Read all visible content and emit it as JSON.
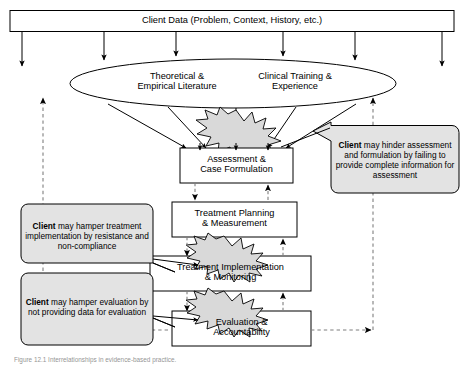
{
  "figure": {
    "type": "flow-diagram",
    "title_box": {
      "label": "Client Data (Problem, Context, History, etc.)"
    },
    "ellipse": {
      "name": "knowledge-base-ellipse",
      "labels": [
        "Theoretical &\nEmpirical Literature",
        "Clinical Training &\nExperience"
      ]
    },
    "process_boxes": [
      {
        "id": "assessment",
        "label": "Assessment &\nCase Formulation"
      },
      {
        "id": "planning",
        "label": "Treatment Planning\n& Measurement"
      },
      {
        "id": "implementation",
        "label": "Treatment Implementation\n& Monitoring"
      },
      {
        "id": "evaluation",
        "label": "Evaluation &\nAccountability"
      }
    ],
    "callouts": [
      {
        "id": "callout-assessment",
        "side": "right",
        "bold_lead": "Client",
        "rest": " may hinder assessment and formulation by failing to provide complete information for assessment",
        "full": "Client may hinder assessment and formulation by failing to provide complete information for assessment"
      },
      {
        "id": "callout-implementation",
        "side": "left",
        "bold_lead": "Client",
        "rest": " may hamper treatment implementation by resistance and non-compliance",
        "full": "Client may hamper treatment implementation by resistance and non-compliance"
      },
      {
        "id": "callout-evaluation",
        "side": "left",
        "bold_lead": "Client",
        "rest": " may hamper evaluation by not providing data for evaluation",
        "full": "Client may hamper evaluation by not providing data for evaluation"
      }
    ],
    "bursts": [
      {
        "id": "burst-assessment"
      },
      {
        "id": "burst-implementation"
      },
      {
        "id": "burst-evaluation"
      }
    ],
    "colors": {
      "stroke": "#000000",
      "burst_fill": "#d9d9d9",
      "callout_fill": "#e3e3e3",
      "box_fill": "#ffffff",
      "dashed": "#7f7f7f",
      "caption": "#3a3a3a"
    },
    "caption": "Figure 12.1 Interrelationships in evidence-based practice."
  }
}
